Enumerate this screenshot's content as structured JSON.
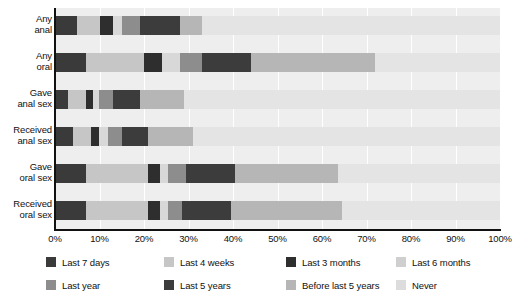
{
  "chart_data": {
    "type": "bar",
    "orientation": "horizontal",
    "stacked": true,
    "stack_mode": "percent",
    "title": "",
    "subtitle": "",
    "xlabel": "",
    "ylabel": "",
    "xlim": [
      0,
      100
    ],
    "xticks": [
      "0%",
      "10%",
      "20%",
      "30%",
      "40%",
      "50%",
      "60%",
      "70%",
      "80%",
      "90%",
      "100%"
    ],
    "xtick_values": [
      0,
      10,
      20,
      30,
      40,
      50,
      60,
      70,
      80,
      90,
      100
    ],
    "grid": true,
    "grid_axis": "x",
    "legend_position": "bottom",
    "categories": [
      "Any anal",
      "Any oral",
      "Gave anal sex",
      "Received anal sex",
      "Gave oral sex",
      "Received oral sex"
    ],
    "category_label_lines": [
      [
        "Any",
        "anal"
      ],
      [
        "Any",
        "oral"
      ],
      [
        "Gave",
        "anal sex"
      ],
      [
        "Received",
        "anal sex"
      ],
      [
        "Gave",
        "oral sex"
      ],
      [
        "Received",
        "oral sex"
      ]
    ],
    "series": [
      {
        "name": "Last 7 days",
        "color": "#3a3a3a",
        "values": [
          5,
          7,
          3,
          4,
          7,
          7
        ]
      },
      {
        "name": "Last 4 weeks",
        "color": "#c6c6c6",
        "values": [
          5,
          13,
          4,
          4,
          14,
          14
        ]
      },
      {
        "name": "Last 3 months",
        "color": "#2e2e2e",
        "values": [
          3,
          4,
          1.5,
          2,
          2.5,
          2.5
        ]
      },
      {
        "name": "Last 6 months",
        "color": "#d8d8d8",
        "values": [
          2,
          4,
          1.5,
          2,
          2,
          2
        ]
      },
      {
        "name": "Last year",
        "color": "#8d8d8d",
        "values": [
          4,
          5,
          3,
          3,
          4,
          3
        ]
      },
      {
        "name": "Last 5 years",
        "color": "#3c3c3c",
        "values": [
          9,
          11,
          6,
          6,
          11,
          11
        ]
      },
      {
        "name": "Before last 5 years",
        "color": "#b6b6b6",
        "values": [
          5,
          28,
          10,
          10,
          23,
          25
        ]
      },
      {
        "name": "Never",
        "color": "#e4e4e4",
        "values": [
          67,
          28,
          71,
          69,
          36.5,
          35.5
        ]
      }
    ]
  },
  "legend": {
    "items": [
      {
        "label": "Last 7 days",
        "color": "#3a3a3a"
      },
      {
        "label": "Last 4 weeks",
        "color": "#c6c6c6"
      },
      {
        "label": "Last 3 months",
        "color": "#2e2e2e"
      },
      {
        "label": "Last 6 months",
        "color": "#cfcfcf"
      },
      {
        "label": "Last year",
        "color": "#8d8d8d"
      },
      {
        "label": "Last 5 years",
        "color": "#3c3c3c"
      },
      {
        "label": "Before last 5 years",
        "color": "#b6b6b6"
      },
      {
        "label": "Never",
        "color": "#dcdcdc"
      }
    ]
  },
  "colors": {
    "plot_background": "#eeeeee",
    "gridline": "#ffffff",
    "axis": "#111111",
    "text": "#111111",
    "page_background": "#ffffff"
  }
}
